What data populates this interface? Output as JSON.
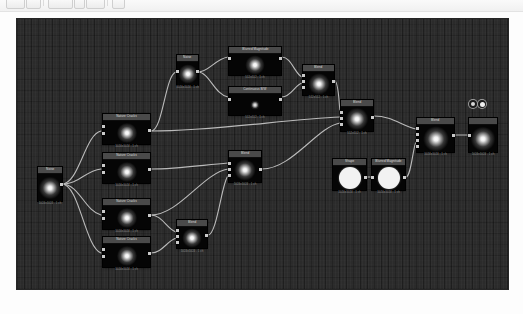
{
  "app": {
    "title": "Node Graph Editor",
    "canvas_bg": "#2b2b2b",
    "node_bg": "#050505",
    "node_title_bg": "#4a4a4a",
    "wire_color": "#cfcfcf",
    "port_color": "#c9c9c9",
    "caption_color": "#8e8e8e"
  },
  "toolbar": {
    "buttons": [
      {
        "name": "open-button",
        "label": ""
      },
      {
        "name": "save-button",
        "label": ""
      },
      {
        "name": "undo-button",
        "label": ""
      },
      {
        "name": "redo-button",
        "label": ""
      },
      {
        "name": "zoom-button",
        "label": ""
      },
      {
        "name": "fit-button",
        "label": ""
      }
    ]
  },
  "graph": {
    "title": "Node Graph",
    "nodes": [
      {
        "id": "n01",
        "name": "source-node",
        "title": "Noise",
        "caption": "1024x1024 - 1 ch",
        "thumb": "glow",
        "inputs": 0,
        "outputs": 1
      },
      {
        "id": "n02",
        "name": "noise-node-a",
        "title": "Noise",
        "caption": "1024x1024 - 1 ch",
        "thumb": "glow",
        "inputs": 1,
        "outputs": 1
      },
      {
        "id": "n03",
        "name": "blurred-magnitude",
        "title": "Blurred Magnitude",
        "caption": "512x512 - 1 ch",
        "thumb": "glow",
        "inputs": 1,
        "outputs": 1
      },
      {
        "id": "n04",
        "name": "continuous-bw",
        "title": "Continuous B/W",
        "caption": "512x512 - 1 ch",
        "thumb": "softdot",
        "inputs": 1,
        "outputs": 1
      },
      {
        "id": "n05",
        "name": "blend-node-top",
        "title": "Blend",
        "caption": "512x512 - 1 ch",
        "thumb": "glow",
        "inputs": 3,
        "outputs": 1
      },
      {
        "id": "n06",
        "name": "blend-node-mid",
        "title": "Blend",
        "caption": "512x512 - 1 ch",
        "thumb": "glow",
        "inputs": 3,
        "outputs": 1
      },
      {
        "id": "n07",
        "name": "nature-cracks-a",
        "title": "Nature Cracks",
        "caption": "1024x1024 - 1 ch",
        "thumb": "glow",
        "inputs": 2,
        "outputs": 1
      },
      {
        "id": "n08",
        "name": "nature-cracks-b",
        "title": "Nature Cracks",
        "caption": "1024x1024 - 1 ch",
        "thumb": "glow",
        "inputs": 2,
        "outputs": 1
      },
      {
        "id": "n09",
        "name": "nature-cracks-c",
        "title": "Nature Cracks",
        "caption": "1024x1024 - 1 ch",
        "thumb": "glow",
        "inputs": 2,
        "outputs": 1
      },
      {
        "id": "n10",
        "name": "nature-cracks-d",
        "title": "Nature Cracks",
        "caption": "1024x1024 - 1 ch",
        "thumb": "glow",
        "inputs": 2,
        "outputs": 1
      },
      {
        "id": "n11",
        "name": "blend-node-lowleft",
        "title": "Blend",
        "caption": "1024x1024 - 1 ch",
        "thumb": "glow",
        "inputs": 3,
        "outputs": 1
      },
      {
        "id": "n12",
        "name": "blend-node-left",
        "title": "Blend",
        "caption": "1024x1024 - 1 ch",
        "thumb": "glow",
        "inputs": 3,
        "outputs": 1
      },
      {
        "id": "n13",
        "name": "shape-node",
        "title": "Shape",
        "caption": "1024x1024 - 1 ch",
        "thumb": "solid",
        "inputs": 0,
        "outputs": 1
      },
      {
        "id": "n14",
        "name": "blurred-magnitude-2",
        "title": "Blurred Magnitude",
        "caption": "1024x1024 - 1 ch",
        "thumb": "solid",
        "inputs": 1,
        "outputs": 1
      },
      {
        "id": "n15",
        "name": "blend-node-final",
        "title": "Blend",
        "caption": "1024x1024 - 1 ch",
        "thumb": "glow",
        "inputs": 4,
        "outputs": 1
      },
      {
        "id": "n16",
        "name": "output-node",
        "title": "",
        "caption": "1024x1024 - 1 ch",
        "thumb": "glow",
        "inputs": 1,
        "outputs": 0
      }
    ],
    "badges": [
      {
        "name": "viewer-badge-a",
        "glyph": "●"
      },
      {
        "name": "viewer-badge-b",
        "glyph": "●"
      }
    ],
    "connection_count": 18
  }
}
